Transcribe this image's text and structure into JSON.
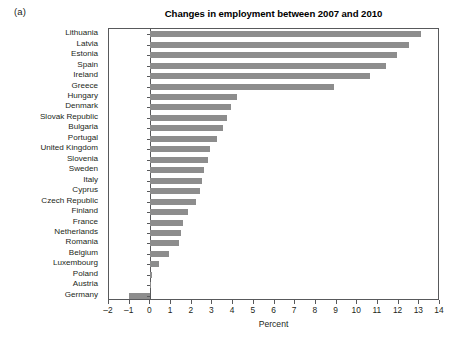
{
  "panel": {
    "label": "(a)"
  },
  "chart_data": {
    "type": "bar",
    "orientation": "horizontal",
    "title": "Changes in employment between 2007 and 2010",
    "xlabel": "Percent",
    "ylabel": "",
    "xlim": [
      -2,
      14
    ],
    "xticks": [
      -2,
      -1,
      0,
      1,
      2,
      3,
      4,
      5,
      6,
      7,
      8,
      9,
      10,
      11,
      12,
      13,
      14
    ],
    "xtick_labels": [
      "–2",
      "–1",
      "0",
      "1",
      "2",
      "3",
      "4",
      "5",
      "6",
      "7",
      "8",
      "9",
      "10",
      "11",
      "12",
      "13",
      "14"
    ],
    "grid": false,
    "legend": null,
    "bar_color": "#8d8d8d",
    "axis_color": "#58595b",
    "categories": [
      "Lithuania",
      "Latvia",
      "Estonia",
      "Spain",
      "Ireland",
      "Greece",
      "Hungary",
      "Denmark",
      "Slovak Republic",
      "Bulgaria",
      "Portugal",
      "United Kingdom",
      "Slovenia",
      "Sweden",
      "Italy",
      "Cyprus",
      "Czech Republic",
      "Finland",
      "France",
      "Netherlands",
      "Romania",
      "Belgium",
      "Luxembourg",
      "Poland",
      "Austria",
      "Germany"
    ],
    "values": [
      13.1,
      12.5,
      11.9,
      11.4,
      10.6,
      8.9,
      4.2,
      3.9,
      3.7,
      3.5,
      3.2,
      2.9,
      2.8,
      2.6,
      2.5,
      2.4,
      2.2,
      1.8,
      1.6,
      1.5,
      1.4,
      0.9,
      0.4,
      0.1,
      0.05,
      -1.05
    ]
  }
}
